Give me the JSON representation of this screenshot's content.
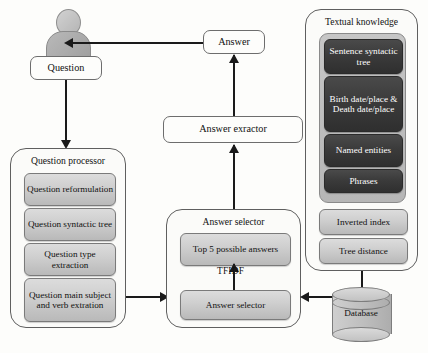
{
  "diagram": {
    "nodes": {
      "user_icon": "user-person-icon",
      "question": "Question",
      "answer": "Answer",
      "answer_extractor": "Answer exractor",
      "database": "Database"
    },
    "question_processor": {
      "title": "Question processor",
      "steps": [
        "Question reformulation",
        "Question syntactic tree",
        "Question type extraction",
        "Question main subject and verb extration"
      ]
    },
    "answer_selector": {
      "title": "Answer selector",
      "top_box": "Top 5 possible answers",
      "edge_label": "TFIDF",
      "bottom_box": "Answer selector"
    },
    "textual_knowledge": {
      "title": "Textual knowledge",
      "dark_items": [
        "Sentence syntactic tree",
        "Birth date/place & Death date/place",
        "Named entities",
        "Phrases"
      ],
      "light_items": [
        "Inverted index",
        "Tree distance"
      ]
    },
    "colors": {
      "background": "#fdfdfb",
      "line": "#1a1a1a",
      "grey_fill": "#cfcfcf",
      "dark_fill": "#3b3b3b",
      "dark_text": "#ffffff",
      "border": "#6d6d6d"
    }
  }
}
